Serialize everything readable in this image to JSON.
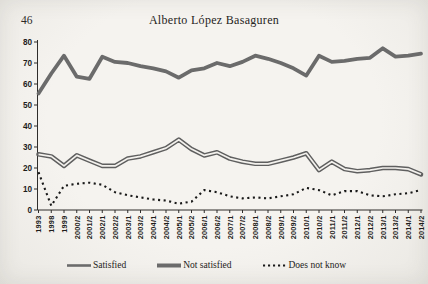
{
  "page": {
    "number": "46",
    "header_title": "Alberto López Basaguren"
  },
  "chart_data": {
    "type": "line",
    "title": "",
    "xlabel": "",
    "ylabel": "",
    "ylim": [
      0,
      80
    ],
    "ytick_step": 10,
    "grid": false,
    "legend_position": "bottom",
    "categories": [
      "1993",
      "1998",
      "1999",
      "2000/2",
      "2001/2",
      "2002/1",
      "2002/2",
      "2003/1",
      "2003/2",
      "2004/1",
      "2004/2",
      "2005/1",
      "2005/2",
      "2006/1",
      "2006/2",
      "2007/1",
      "2007/2",
      "2008/1",
      "2008/2",
      "2009/1",
      "2009/2",
      "2010/1",
      "2010/2",
      "2011/1",
      "2011/2",
      "2012/1",
      "2012/2",
      "2013/1",
      "2013/2",
      "2014/1",
      "2014/2"
    ],
    "series": [
      {
        "name": "Satisfied",
        "style": "double-gray",
        "color": "#5f5f5f",
        "values": [
          26.5,
          25.5,
          21,
          26,
          23.5,
          21,
          21,
          24.5,
          25.5,
          27.5,
          29.5,
          33.5,
          29,
          26,
          27.5,
          24.5,
          23,
          22,
          22,
          23.5,
          25,
          27,
          19,
          23,
          19.5,
          18.5,
          19,
          20,
          20,
          19.5,
          17
        ]
      },
      {
        "name": "Not satisfied",
        "style": "thick-gray",
        "color": "#6b6b6b",
        "values": [
          55.5,
          65,
          73.5,
          63.5,
          62.5,
          73,
          70.5,
          70,
          68.5,
          67.5,
          66,
          63,
          66.5,
          67.5,
          70,
          68.5,
          70.5,
          73.5,
          72,
          70,
          67.5,
          64,
          73.5,
          70.5,
          71,
          72,
          72.5,
          77,
          73,
          73.5,
          74.5
        ]
      },
      {
        "name": "Does not know",
        "style": "dotted-black",
        "color": "#191919",
        "values": [
          18,
          2,
          11.5,
          12.5,
          13,
          12,
          8.5,
          7,
          6,
          5,
          4.5,
          3,
          4,
          9.5,
          8.5,
          6.5,
          5.5,
          6,
          5.5,
          6.5,
          7.5,
          10.5,
          9.5,
          7,
          9,
          9,
          7,
          6.5,
          7.5,
          8,
          9.5
        ]
      }
    ],
    "axis_color": "#2f2d2b",
    "label_color": "#1e1d1b"
  }
}
